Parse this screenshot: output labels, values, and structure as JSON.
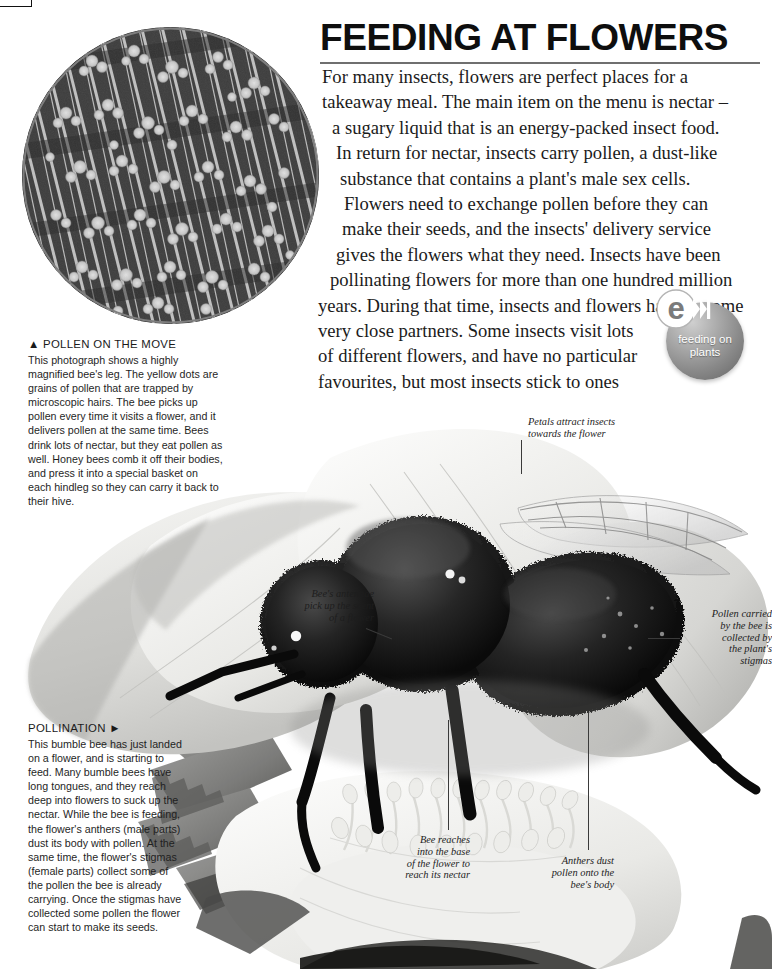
{
  "page": {
    "headline": "FEEDING AT FLOWERS",
    "intro_lines": [
      "For many insects, flowers are perfect places for a",
      "takeaway meal. The main item on the menu is nectar –",
      "a sugary liquid that is an energy-packed insect food.",
      "In return for nectar, insects carry pollen, a dust-like",
      "substance that contains a plant's male sex cells.",
      "Flowers need to exchange pollen before they can",
      "make their seeds, and the insects' delivery service",
      "gives the flowers what they need. Insects have been",
      "pollinating flowers for more than one hundred million",
      "years. During that time, insects and flowers have become",
      "very close partners. Some insects visit lots",
      "of different flowers, and have no particular",
      "favourites, but most insects stick to ones",
      "that are the right shape for them to feed."
    ]
  },
  "badge": {
    "logo_letter": "e",
    "line1": "feeding on",
    "line2": "plants"
  },
  "captions": {
    "pollen": {
      "title": "▲ POLLEN ON THE MOVE",
      "body": "This photograph shows a highly magnified bee's leg. The yellow dots are grains of pollen that are trapped by microscopic hairs. The bee picks up pollen every time it visits a flower, and it delivers pollen at the same time. Bees drink lots of nectar, but they eat pollen as well. Honey bees comb it off their bodies, and press it into a special basket on each hindleg so they can carry it back to their hive."
    },
    "pollination": {
      "title": "POLLINATION ►",
      "body": "This bumble bee has just landed on a flower, and is starting to feed. Many bumble bees have long tongues, and they reach deep into flowers to suck up the nectar. While the bee is feeding, the flower's anthers (male parts) dust its body with pollen. At the same time, the flower's stigmas (female parts) collect some of the pollen the bee is already carrying. Once the stigmas have collected some pollen the flower can start to make its seeds."
    }
  },
  "annotations": {
    "petals": "Petals attract insects\ntowards the flower",
    "antennae": "Bee's antennae\npick up the scent\nof a flower",
    "pollen_carried": "Pollen carried\nby the bee is\ncollected by\nthe plant's\nstigmas",
    "bee_reaches": "Bee reaches\ninto the base\nof the flower to\nreach its nectar",
    "anthers": "Anthers dust\npollen onto the\nbee's body"
  },
  "colors": {
    "text": "#1b1b1b",
    "rule": "#6f6f6f",
    "badge_ball": "#8a8a8a",
    "background": "#ffffff"
  }
}
